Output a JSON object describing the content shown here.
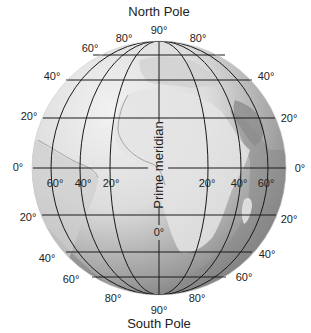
{
  "diagram": {
    "title_top": "North Pole",
    "title_bottom": "South Pole",
    "prime_meridian_label": "Prime meridian",
    "prime_meridian_degree": "0°",
    "north_pole_degree": "90°",
    "south_pole_degree": "90°",
    "latitude_labels_left": {
      "n80": "80°",
      "n60": "60°",
      "n40": "40°",
      "n20": "20°",
      "eq": "0°",
      "s20": "20°",
      "s40": "40°",
      "s60": "60°",
      "s80": "80°"
    },
    "latitude_labels_right": {
      "n80": "80°",
      "n40": "40°",
      "n20": "20°",
      "eq": "0°",
      "s20": "20°",
      "s40": "40°",
      "s60": "60°",
      "s80": "80°"
    },
    "longitude_labels": {
      "w60": "60°",
      "w40": "40°",
      "w20": "20°",
      "e20": "20°",
      "e40": "40°",
      "e60": "60°"
    },
    "colors": {
      "globe_light": "#ececec",
      "globe_mid": "#bdbdbd",
      "globe_dark": "#6e6e6e",
      "land_light": "#e2e2e2",
      "grid": "#1a1a1a",
      "text": "#222222"
    }
  }
}
